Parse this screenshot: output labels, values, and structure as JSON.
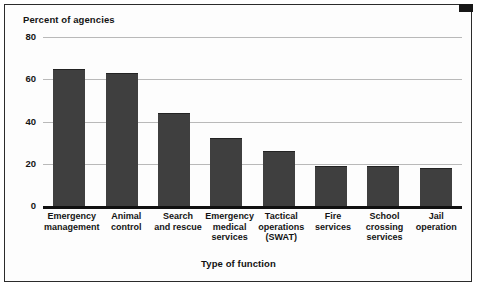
{
  "chart_data": {
    "type": "bar",
    "title": "",
    "ylabel": "Percent of agencies",
    "xlabel": "Type of function",
    "ylim": [
      0,
      80
    ],
    "yticks": [
      0,
      20,
      40,
      60,
      80
    ],
    "ytick_labels": [
      "0",
      "20",
      "40",
      "60",
      "80"
    ],
    "grid": true,
    "legend": "none",
    "bar_color": "#3f3f3f",
    "categories": [
      "Emergency management",
      "Animal control",
      "Search and rescue",
      "Emergency medical services",
      "Tactical operations (SWAT)",
      "Fire services",
      "School crossing services",
      "Jail operation"
    ],
    "category_lines": [
      [
        "Emergency",
        "management"
      ],
      [
        "Animal",
        "control"
      ],
      [
        "Search",
        "and rescue"
      ],
      [
        "Emergency",
        "medical",
        "services"
      ],
      [
        "Tactical",
        "operations",
        "(SWAT)"
      ],
      [
        "Fire",
        "services"
      ],
      [
        "School",
        "crossing",
        "services"
      ],
      [
        "Jail",
        "operation"
      ]
    ],
    "values": [
      65,
      63,
      44,
      32,
      26,
      19,
      19,
      18
    ]
  }
}
